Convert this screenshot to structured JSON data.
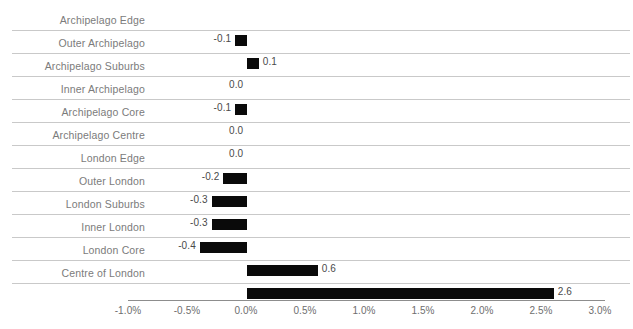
{
  "chart_data": {
    "type": "bar",
    "orientation": "horizontal",
    "title": "",
    "subtitle": "",
    "xlabel": "",
    "ylabel": "",
    "grid": true,
    "legend": null,
    "xlim": [
      -1.0,
      3.0
    ],
    "x_tick_step": 0.5,
    "x_tick_labels": [
      "-1.0%",
      "-0.5%",
      "0.0%",
      "0.5%",
      "1.0%",
      "1.5%",
      "2.0%",
      "2.5%",
      "3.0%"
    ],
    "x_tick_values": [
      -1.0,
      -0.5,
      0.0,
      0.5,
      1.0,
      1.5,
      2.0,
      2.5,
      3.0
    ],
    "value_label_format": "one-decimal",
    "categories": [
      "Archipelago Edge",
      "Outer Archipelago",
      "Archipelago Suburbs",
      "Inner Archipelago",
      "Archipelago Core",
      "Archipelago Centre",
      "London Edge",
      "Outer London",
      "London Suburbs",
      "Inner London",
      "London Core",
      "Centre of London"
    ],
    "values": [
      -0.1,
      0.1,
      0.0,
      -0.1,
      0.0,
      0.0,
      -0.2,
      -0.3,
      -0.3,
      -0.4,
      0.6,
      2.6
    ],
    "value_labels": [
      "-0.1",
      "0.1",
      "0.0",
      "-0.1",
      "0.0",
      "0.0",
      "-0.2",
      "-0.3",
      "-0.3",
      "-0.4",
      "0.6",
      "2.6"
    ],
    "colors": {
      "bar": "#0a0a0a",
      "gridline": "#c9c9c9",
      "axis_line": "#8d8d8d",
      "category_text": "#7b7b7b",
      "value_text": "#4a4a4a",
      "tick_text": "#6e6e6e",
      "background": "#ffffff"
    }
  }
}
